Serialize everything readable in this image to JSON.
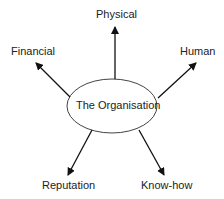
{
  "diagram": {
    "center": {
      "label": "The Organisation"
    },
    "nodes": [
      {
        "id": "physical",
        "label": "Physical"
      },
      {
        "id": "financial",
        "label": "Financial"
      },
      {
        "id": "human",
        "label": "Human"
      },
      {
        "id": "reputation",
        "label": "Reputation"
      },
      {
        "id": "knowhow",
        "label": "Know-how"
      }
    ],
    "edges": [
      {
        "from": "The Organisation",
        "to": "Physical"
      },
      {
        "from": "The Organisation",
        "to": "Financial"
      },
      {
        "from": "The Organisation",
        "to": "Human"
      },
      {
        "from": "The Organisation",
        "to": "Reputation"
      },
      {
        "from": "The Organisation",
        "to": "Know-how"
      }
    ]
  }
}
